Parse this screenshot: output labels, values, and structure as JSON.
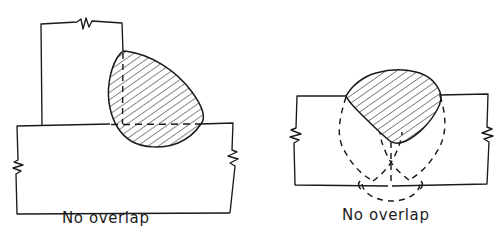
{
  "figure": {
    "background_color": "#ffffff",
    "ink_color": "#1a1a1a",
    "panels": [
      {
        "id": "left-panel",
        "name": "tee-fillet-weld-cross-section",
        "caption": "No overlap",
        "joint_type": "tee joint / fillet weld",
        "view": "cross-section",
        "members": [
          {
            "name": "vertical-plate",
            "orientation": "vertical",
            "break_symbol": "zigzag-break-top"
          },
          {
            "name": "horizontal-plate",
            "orientation": "horizontal",
            "break_symbol": "zigzag-break-left-and-right"
          }
        ],
        "weld_bead": {
          "name": "fillet-weld-bead",
          "fill": "diagonal-hatching",
          "hatch_angle_deg": 60,
          "outline": "solid"
        },
        "hidden_lines": [
          {
            "name": "plate-surface-hidden-line",
            "style": "dashed",
            "orientation": "horizontal"
          },
          {
            "name": "vertical-plate-face-hidden-line",
            "style": "dashed",
            "orientation": "vertical"
          }
        ]
      },
      {
        "id": "right-panel",
        "name": "butt-weld-cross-section",
        "caption": "No overlap",
        "joint_type": "butt joint / groove weld",
        "view": "cross-section",
        "members": [
          {
            "name": "left-plate",
            "orientation": "horizontal",
            "break_symbol": "zigzag-break-left"
          },
          {
            "name": "right-plate",
            "orientation": "horizontal",
            "break_symbol": "zigzag-break-right"
          }
        ],
        "weld_bead": {
          "name": "groove-weld-bead",
          "fill": "diagonal-hatching",
          "hatch_angle_deg": 60,
          "outline": "solid"
        },
        "hidden_lines": [
          {
            "name": "fusion-boundary-hidden-curves",
            "style": "dashed",
            "shape": "hourglass-crossing-curves"
          },
          {
            "name": "weld-centerline-hidden-line",
            "style": "dashed",
            "orientation": "vertical"
          },
          {
            "name": "root-reinforcement-hidden-arc",
            "style": "dashed",
            "shape": "arc"
          }
        ]
      }
    ]
  }
}
